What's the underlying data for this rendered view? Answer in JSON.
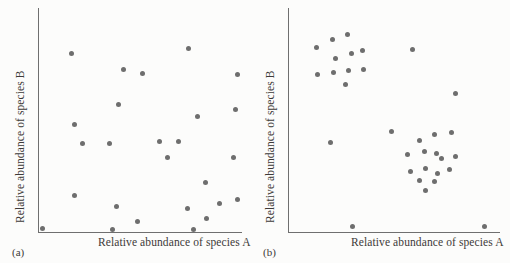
{
  "figure": {
    "background_color": "#ffffff",
    "point_color": "#6e6e6e",
    "axis_color": "#6f6f6f",
    "text_color": "#3d3a38"
  },
  "panels": [
    {
      "caption": "(a)",
      "xlabel": "Relative abundance of species A",
      "ylabel": "Relative abundance of species B"
    },
    {
      "caption": "(b)",
      "xlabel": "Relative abundance of species A",
      "ylabel": "Relative abundance of species B"
    }
  ],
  "chart_data": [
    {
      "type": "scatter",
      "title": "(a)",
      "xlabel": "Relative abundance of species A",
      "ylabel": "Relative abundance of species B",
      "xlim": [
        0,
        100
      ],
      "ylim": [
        0,
        100
      ],
      "grid": false,
      "legend": "none",
      "annotation": "Random (independent) distribution of the two species",
      "n_points": 27,
      "series": [
        {
          "name": "samples",
          "points": [
            [
              16.2,
              79.7
            ],
            [
              41.6,
              72.4
            ],
            [
              50.8,
              70.6
            ],
            [
              73.8,
              82.0
            ],
            [
              97.6,
              70.4
            ],
            [
              39.4,
              56.8
            ],
            [
              97.0,
              54.8
            ],
            [
              78.0,
              51.4
            ],
            [
              21.5,
              39.6
            ],
            [
              34.7,
              39.4
            ],
            [
              59.4,
              40.6
            ],
            [
              68.8,
              40.6
            ],
            [
              63.5,
              33.4
            ],
            [
              96.0,
              33.2
            ],
            [
              82.1,
              22.1
            ],
            [
              17.3,
              16.2
            ],
            [
              97.6,
              14.4
            ],
            [
              38.4,
              11.6
            ],
            [
              73.2,
              10.4
            ],
            [
              88.8,
              12.6
            ],
            [
              82.6,
              6.1
            ],
            [
              48.4,
              4.7
            ],
            [
              1.7,
              1.6
            ],
            [
              36.4,
              1.3
            ],
            [
              76.0,
              0.9
            ],
            [
              56.2,
              -6.0
            ],
            [
              17.5,
              48.0
            ]
          ]
        }
      ]
    },
    {
      "type": "scatter",
      "title": "(b)",
      "xlabel": "Relative abundance of species A",
      "ylabel": "Relative abundance of species B",
      "xlim": [
        0,
        100
      ],
      "ylim": [
        0,
        100
      ],
      "grid": false,
      "legend": "none",
      "annotation": "Clustered (aggregated) distribution forming two groups",
      "n_points": 30,
      "series": [
        {
          "name": "cluster-upper-left",
          "points": [
            [
              13.0,
              82.5
            ],
            [
              20.5,
              86.0
            ],
            [
              27.5,
              88.0
            ],
            [
              22.0,
              77.5
            ],
            [
              29.5,
              79.5
            ],
            [
              35.0,
              81.0
            ],
            [
              13.5,
              70.5
            ],
            [
              21.0,
              71.0
            ],
            [
              28.0,
              72.0
            ],
            [
              35.5,
              72.5
            ],
            [
              27.0,
              66.0
            ]
          ]
        },
        {
          "name": "cluster-lower-right",
          "points": [
            [
              62.0,
              41.0
            ],
            [
              69.0,
              43.5
            ],
            [
              77.0,
              44.5
            ],
            [
              56.0,
              34.5
            ],
            [
              64.0,
              36.0
            ],
            [
              70.0,
              35.0
            ],
            [
              72.5,
              33.0
            ],
            [
              79.0,
              33.5
            ],
            [
              57.5,
              27.0
            ],
            [
              64.5,
              28.5
            ],
            [
              70.5,
              26.0
            ],
            [
              76.0,
              28.0
            ],
            [
              62.0,
              23.0
            ],
            [
              69.0,
              22.5
            ],
            [
              64.5,
              18.5
            ]
          ]
        },
        {
          "name": "outliers",
          "points": [
            [
              58.5,
              81.5
            ],
            [
              79.0,
              62.0
            ],
            [
              48.5,
              45.0
            ],
            [
              19.5,
              40.0
            ],
            [
              30.0,
              2.5
            ],
            [
              92.5,
              2.5
            ]
          ]
        }
      ]
    }
  ]
}
